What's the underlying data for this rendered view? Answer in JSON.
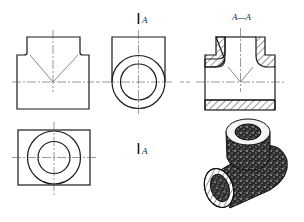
{
  "drawing": {
    "title": "Orthographic and section views of a pipe tee",
    "views": [
      {
        "id": "front-view",
        "label": ""
      },
      {
        "id": "side-view",
        "label": ""
      },
      {
        "id": "section-view",
        "label": "A—A"
      },
      {
        "id": "top-view",
        "label": ""
      },
      {
        "id": "isometric-view",
        "label": ""
      }
    ],
    "section_markers": {
      "top": "A",
      "bottom": "A"
    },
    "section_title": "A—A",
    "header_cut_text": "",
    "colors": {
      "line": "#1a1a1a",
      "centerline": "#555555",
      "hatch": "#333333",
      "background": "#ffffff"
    }
  }
}
